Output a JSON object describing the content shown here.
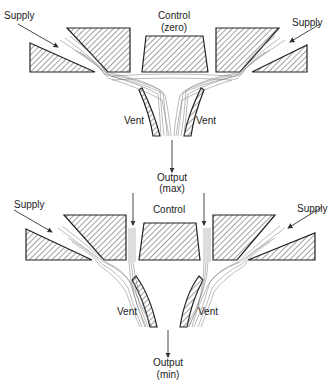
{
  "diagrams": [
    {
      "id": "top",
      "state": "control zero",
      "labels": {
        "supply_left": "Supply",
        "supply_right": "Supply",
        "control": "Control",
        "control_state": "(zero)",
        "vent_left": "Vent",
        "vent_right": "Vent",
        "output": "Output",
        "output_state": "(max)"
      }
    },
    {
      "id": "bottom",
      "state": "control on",
      "labels": {
        "supply_left": "Supply",
        "supply_right": "Supply",
        "control": "Control",
        "vent_left": "Vent",
        "vent_right": "Vent",
        "output": "Output",
        "output_state": "(min)"
      }
    }
  ],
  "colors": {
    "ink": "#222222",
    "flow": "#777777",
    "background": "#ffffff"
  }
}
